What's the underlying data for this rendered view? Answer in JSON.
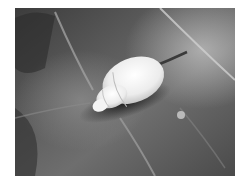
{
  "image": {
    "subject": "white snail shell on a dark leaf",
    "style": "grayscale photograph",
    "colors": {
      "background": "#ffffff",
      "leaf_dark": "#2a2a2a",
      "leaf_mid": "#6b6b6b",
      "leaf_light": "#9a9a9a",
      "shell": "#f2f2f2"
    }
  }
}
